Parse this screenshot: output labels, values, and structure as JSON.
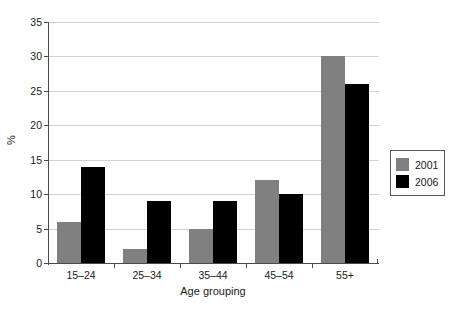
{
  "chart_data": {
    "type": "bar",
    "title": "",
    "subtitle": "",
    "xlabel": "Age grouping",
    "ylabel": "%",
    "categories": [
      "15–24",
      "25–34",
      "35–44",
      "45–54",
      "55+"
    ],
    "series": [
      {
        "name": "2001",
        "color": "#808080",
        "values": [
          6,
          2,
          5,
          12,
          30
        ]
      },
      {
        "name": "2006",
        "color": "#000000",
        "values": [
          14,
          9,
          9,
          10,
          26
        ]
      }
    ],
    "ylim": [
      0,
      35
    ],
    "yticks": [
      0,
      5,
      10,
      15,
      20,
      25,
      30,
      35
    ],
    "ytick_labels": [
      "0",
      "5",
      "10",
      "15",
      "20",
      "25",
      "30",
      "35"
    ],
    "grid": "horizontal",
    "legend_position": "right",
    "legend_entries": [
      "2001",
      "2006"
    ]
  }
}
